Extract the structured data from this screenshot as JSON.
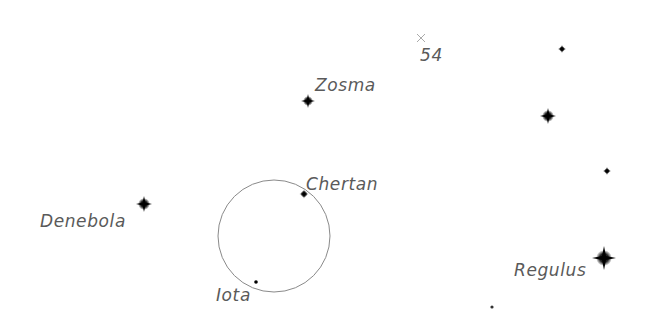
{
  "map": {
    "type": "star-chart",
    "background": "#ffffff",
    "label_color": "#5a5a5a",
    "star_color": "#000000",
    "field_circle": {
      "cx": 274,
      "cy": 236,
      "r": 56,
      "stroke": "#8a8a8a"
    },
    "marker": {
      "symbol": "×",
      "x": 421,
      "y": 38,
      "color": "#aaaaaa"
    },
    "labels": {
      "m54": "54",
      "zosma": "Zosma",
      "chertan": "Chertan",
      "denebola": "Denebola",
      "iota": "Iota",
      "regulus": "Regulus"
    },
    "stars": [
      {
        "name": "Zosma",
        "x": 308,
        "y": 101,
        "size": 5
      },
      {
        "name": "Chertan",
        "x": 304,
        "y": 194,
        "size": 3.5
      },
      {
        "name": "Denebola",
        "x": 144,
        "y": 204,
        "size": 6
      },
      {
        "name": "Iota",
        "x": 256,
        "y": 282,
        "size": 2
      },
      {
        "name": "Regulus",
        "x": 604,
        "y": 258,
        "size": 8
      },
      {
        "name": "",
        "x": 562,
        "y": 49,
        "size": 3
      },
      {
        "name": "",
        "x": 548,
        "y": 116,
        "size": 6
      },
      {
        "name": "",
        "x": 607,
        "y": 171,
        "size": 3
      },
      {
        "name": "",
        "x": 492,
        "y": 307,
        "size": 1.5
      }
    ]
  }
}
